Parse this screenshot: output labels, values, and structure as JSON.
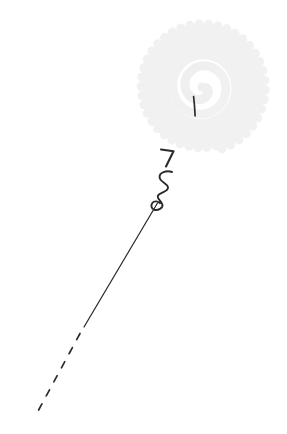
{
  "canvas": {
    "width": 287,
    "height": 434,
    "background_color": "#ffffff",
    "alt_text": "Line drawing of a tethered spiral disc with a coiled string and dashed tail"
  },
  "palette": {
    "ink": "#2b2b2b",
    "ink_soft": "#3a3a3a",
    "spiral_dot": "#f1f1f1",
    "spiral_dot_inner": "#efefef",
    "background": "#ffffff"
  },
  "figure": {
    "parts": [
      {
        "name": "spiral-disc",
        "description": "Dense spiral of very faint gray dots forming a round disc",
        "center_x": 202,
        "center_y": 87,
        "radius_x": 64,
        "radius_y": 65,
        "dot_radius": 4.6,
        "turns": 7.2,
        "dot_count": 300,
        "color": "#f1f1f1"
      },
      {
        "name": "inner-tick-mark",
        "description": "Short dark vertical tick inside the lower middle of the disc",
        "x1": 194,
        "y1": 96,
        "x2": 195,
        "y2": 116,
        "stroke_width": 1.6,
        "color": "#2b2b2b"
      },
      {
        "name": "hook-mark",
        "description": "Small bent hook resembling a digit seven below the disc",
        "stroke_width": 2.1,
        "color": "#2b2b2b"
      },
      {
        "name": "coil-squiggle",
        "description": "Three small loops forming a coiled spring along the tether",
        "stroke_width": 1.9,
        "loops": 3,
        "color": "#2b2b2b"
      },
      {
        "name": "tether-solid",
        "description": "Long thin solid diagonal line running down to the lower left",
        "x1": 157,
        "y1": 203,
        "x2": 84,
        "y2": 327,
        "stroke_width": 1.25,
        "color": "#2b2b2b"
      },
      {
        "name": "tether-dashed",
        "description": "Dashed continuation of the tether toward the bottom left corner",
        "x1": 80,
        "y1": 333,
        "x2": 37,
        "y2": 413,
        "stroke_width": 1.6,
        "dash_pattern": "7 9",
        "dash_count": 6,
        "color": "#2b2b2b"
      }
    ]
  }
}
